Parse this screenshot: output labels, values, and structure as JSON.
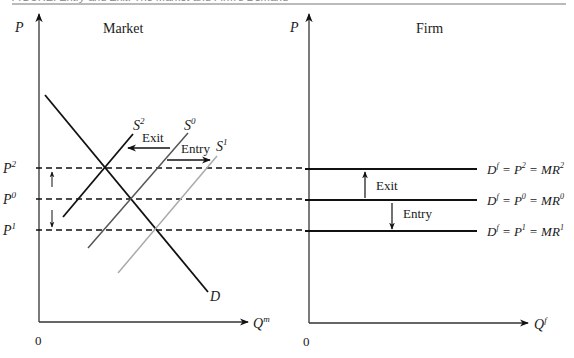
{
  "caption": "FIGURE: Entry and Exit: The Market and Firm's Demand",
  "panels": {
    "market": {
      "title": "Market",
      "y_axis_label": "P",
      "x_axis_label_main": "Q",
      "x_axis_label_sup": "m",
      "origin_label": "0",
      "demand_label": "D",
      "supply_curves": [
        {
          "name": "S",
          "sup": "2",
          "color": "#111111"
        },
        {
          "name": "S",
          "sup": "0",
          "color": "#555555"
        },
        {
          "name": "S",
          "sup": "1",
          "color": "#aaaaaa"
        }
      ],
      "price_levels": [
        {
          "name": "P",
          "sup": "2"
        },
        {
          "name": "P",
          "sup": "0"
        },
        {
          "name": "P",
          "sup": "1"
        }
      ],
      "shift_arrows": {
        "exit_label": "Exit",
        "entry_label": "Entry"
      }
    },
    "firm": {
      "title": "Firm",
      "y_axis_label": "P",
      "x_axis_label_main": "Q",
      "x_axis_label_sup": "f",
      "origin_label": "0",
      "demand_lines": [
        {
          "d": "D",
          "dsup": "f",
          "eq1": " = P",
          "psup": "2",
          "eq2": " = MR",
          "mrsup": "2"
        },
        {
          "d": "D",
          "dsup": "f",
          "eq1": " = P",
          "psup": "0",
          "eq2": " = MR",
          "mrsup": "0"
        },
        {
          "d": "D",
          "dsup": "f",
          "eq1": " = P",
          "psup": "1",
          "eq2": " = MR",
          "mrsup": "1"
        }
      ],
      "shift_arrows": {
        "exit_label": "Exit",
        "entry_label": "Entry"
      }
    }
  }
}
